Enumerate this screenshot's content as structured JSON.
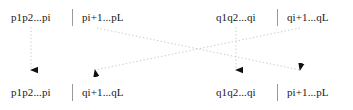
{
  "diagram": {
    "colors": {
      "text": "#1a1a1a",
      "divider": "#9a9a9a",
      "connector": "#c8c8c8",
      "arrowhead": "#111111",
      "background": "#ffffff"
    },
    "parents": {
      "label": "parents-row",
      "chromosome_a": {
        "name": "parent-p",
        "left_segment": "p1p2...pi",
        "right_segment": "pi+1...pL"
      },
      "chromosome_b": {
        "name": "parent-q",
        "left_segment": "q1q2...qi",
        "right_segment": "qi+1...qL"
      }
    },
    "offspring": {
      "label": "offspring-row",
      "chromosome_a": {
        "name": "child-1",
        "left_segment": "p1p2...pi",
        "right_segment": "qi+1...qL"
      },
      "chromosome_b": {
        "name": "child-2",
        "left_segment": "q1q2...qi",
        "right_segment": "pi+1...pL"
      }
    },
    "connectors": [
      {
        "name": "connector-p-head-straight",
        "from": "parent-p-left",
        "to": "child-1-left",
        "style": "dotted-vertical"
      },
      {
        "name": "connector-p-tail-cross",
        "from": "parent-p-right",
        "to": "child-2-right",
        "style": "dotted-diagonal"
      },
      {
        "name": "connector-q-head-straight",
        "from": "parent-q-left",
        "to": "child-2-left",
        "style": "dotted-vertical"
      },
      {
        "name": "connector-q-tail-cross",
        "from": "parent-q-right",
        "to": "child-1-right",
        "style": "dotted-diagonal"
      }
    ]
  }
}
